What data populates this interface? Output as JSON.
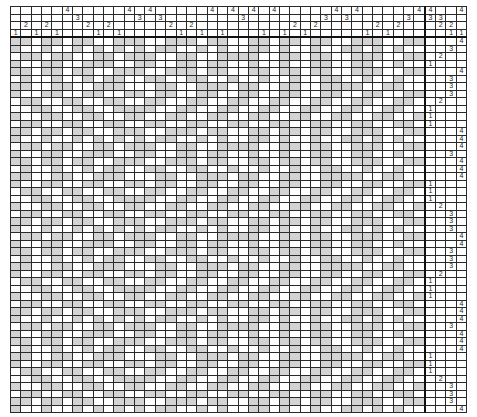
{
  "puzzle": {
    "columns": 40,
    "rows": 50,
    "shade_color": "#d3d3d3",
    "line_color": "#2a2a2a",
    "top_clues": [
      [
        "",
        "",
        "",
        "",
        "",
        "4",
        "",
        "",
        "",
        "",
        "",
        "4",
        "",
        "4",
        "",
        "",
        "",
        "",
        "",
        "4",
        "",
        "4",
        "",
        "4",
        "",
        "4",
        "",
        "",
        "",
        "",
        "",
        "4",
        "",
        "4",
        "",
        "",
        "",
        "",
        "",
        "4"
      ],
      [
        "",
        "",
        "",
        "",
        "",
        "",
        "3",
        "",
        "",
        "",
        "",
        "",
        "3",
        "",
        "3",
        "",
        "",
        "",
        "",
        "",
        "",
        "",
        "3",
        "",
        "",
        "",
        "",
        "",
        "",
        "",
        "3",
        "",
        "3",
        "",
        "",
        "",
        "",
        "",
        "3",
        ""
      ],
      [
        "",
        "2",
        "",
        "2",
        "",
        "",
        "",
        "2",
        "",
        "2",
        "",
        "",
        "",
        "",
        "",
        "2",
        "",
        "2",
        "",
        "",
        "",
        "",
        "",
        "",
        "",
        "",
        "",
        "2",
        "",
        "2",
        "",
        "",
        "",
        "",
        "",
        "2",
        "",
        "2",
        "",
        ""
      ],
      [
        "1",
        "",
        "1",
        "",
        "1",
        "",
        "",
        "",
        "1",
        "",
        "1",
        "",
        "",
        "",
        "",
        "",
        "1",
        "",
        "1",
        "",
        "1",
        "",
        "",
        "",
        "1",
        "",
        "1",
        "",
        "1",
        "",
        "",
        "",
        "",
        "",
        "1",
        "",
        "1",
        "",
        "",
        ""
      ]
    ],
    "corner_clues": [
      [
        "4",
        "",
        "",
        "4"
      ],
      [
        "3",
        "3",
        "",
        ""
      ],
      [
        "",
        "2",
        "2",
        ""
      ],
      [
        "",
        "",
        "1",
        "1"
      ]
    ],
    "right_clues": [
      [
        "",
        "",
        "",
        "4"
      ],
      [
        "",
        "",
        "3",
        ""
      ],
      [
        "",
        "2",
        "",
        ""
      ],
      [
        "1",
        "",
        "",
        ""
      ],
      [
        "",
        "",
        "",
        "4"
      ],
      [
        "",
        "",
        "3",
        ""
      ],
      [
        "",
        "",
        "3",
        ""
      ],
      [
        "",
        "",
        "3",
        ""
      ],
      [
        "",
        "2",
        "",
        ""
      ],
      [
        "1",
        "",
        "",
        ""
      ],
      [
        "1",
        "",
        "",
        ""
      ],
      [
        "1",
        "",
        "",
        ""
      ],
      [
        "",
        "",
        "",
        "4"
      ],
      [
        "",
        "",
        "",
        "4"
      ],
      [
        "",
        "",
        "",
        "4"
      ],
      [
        "",
        "",
        "3",
        ""
      ],
      [
        "",
        "",
        "",
        "4"
      ],
      [
        "",
        "",
        "",
        "4"
      ],
      [
        "",
        "",
        "",
        "4"
      ],
      [
        "1",
        "",
        "",
        ""
      ],
      [
        "1",
        "",
        "",
        ""
      ],
      [
        "1",
        "",
        "",
        ""
      ],
      [
        "",
        "2",
        "",
        ""
      ],
      [
        "",
        "",
        "3",
        ""
      ],
      [
        "",
        "",
        "3",
        ""
      ],
      [
        "",
        "",
        "3",
        ""
      ],
      [
        "",
        "",
        "",
        "4"
      ],
      [
        "",
        "",
        "",
        "4"
      ],
      [
        "",
        "",
        "3",
        ""
      ],
      [
        "",
        "",
        "3",
        ""
      ],
      [
        "",
        "",
        "3",
        ""
      ],
      [
        "",
        "2",
        "",
        ""
      ],
      [
        "1",
        "",
        "",
        ""
      ],
      [
        "1",
        "",
        "",
        ""
      ],
      [
        "1",
        "",
        "",
        ""
      ],
      [
        "",
        "",
        "",
        "4"
      ],
      [
        "",
        "",
        "",
        "4"
      ],
      [
        "",
        "",
        "",
        "4"
      ],
      [
        "",
        "",
        "3",
        ""
      ],
      [
        "",
        "",
        "",
        "4"
      ],
      [
        "",
        "",
        "",
        "4"
      ],
      [
        "",
        "",
        "",
        "4"
      ],
      [
        "1",
        "",
        "",
        ""
      ],
      [
        "1",
        "",
        "",
        ""
      ],
      [
        "1",
        "",
        "",
        ""
      ],
      [
        "",
        "2",
        "",
        ""
      ],
      [
        "",
        "",
        "3",
        ""
      ],
      [
        "",
        "",
        "3",
        ""
      ],
      [
        "",
        "",
        "3",
        ""
      ],
      [
        "",
        "",
        "",
        "4"
      ]
    ],
    "grid": [
      "##.##.##..###..###.##..##.##.##..###..##",
      "#..#..#.#.#.#.##..#.#..##.#..#..##.#.#..",
      ".##.##..##.###..##..####..##.##..###..##",
      "#..##..###..##..##.##..#..#..##..##..#..",
      "##.##.##..###..###.##..##.##.##..###..##",
      ".#..#..#.##..##..##..#..#..#..##..#..#..",
      "##..##..###...##..###.##..##..####..##..",
      "#..##..##..##.##..##..##..##..##..##..##",
      ".##..##..##..##..##..##..##..##..##..##.",
      "..##..##..####..##..##..##..##..##..##..",
      "#..##..##..##..##..##..##..##..##..##..#",
      ".##..##..##..##..##..##..##..##..##..##.",
      "##.##.##..###..###.##..##.##.##..###..##",
      "#..#..#.#.#.#.##..#.#..##.#..#..##.#.#..",
      ".##.##..##.###..##..####..##.##..###..##",
      "#..##..###..##..##.##..#..#..##..##..#..",
      "##.##.##..###..###.##..##.##.##..###..##",
      ".#..#..#.##..##..##..#..#..#..##..#..#..",
      "##..##..###...##..###.##..##..####..##..",
      "#..##..##..##.##..##..##..##..##..##..##",
      ".##..##..##..##..##..##..##..##..##..##.",
      "..##..##..####..##..##..##..##..##..##..",
      "#..##..##..##..##..##..##..##..##..##..#",
      ".##..##..##..##..##..##..##..##..##..##.",
      "##.##.##..###..###.##..##.##.##..###..##",
      "#..#..#.#.#.#.##..#.#..##.#..#..##.#.#..",
      ".##.##..##.###..##..####..##.##..###..##",
      "#..##..###..##..##.##..#..#..##..##..#..",
      "##.##.##..###..###.##..##.##.##..###..##",
      ".#..#..#.##..##..##..#..#..#..##..#..#..",
      "##..##..###...##..###.##..##..####..##..",
      "#..##..##..##.##..##..##..##..##..##..##",
      ".##..##..##..##..##..##..##..##..##..##.",
      "..##..##..####..##..##..##..##..##..##..",
      "#..##..##..##..##..##..##..##..##..##..#",
      ".##..##..##..##..##..##..##..##..##..##.",
      "##.##.##..###..###.##..##.##.##..###..##",
      "#..#..#.#.#.#.##..#.#..##.#..#..##.#.#..",
      ".##.##..##.###..##..####..##.##..###..##",
      "#..##..###..##..##.##..#..#..##..##..#..",
      "##.##.##..###..###.##..##.##.##..###..##",
      ".#..#..#.##..##..##..#..#..#..##..#..#..",
      "##..##..###...##..###.##..##..####..##..",
      "#..##..##..##.##..##..##..##..##..##..##",
      ".##..##..##..##..##..##..##..##..##..##.",
      "..##..##..####..##..##..##..##..##..##..",
      "#..##..##..##..##..##..##..##..##..##..#",
      ".##..##..##..##..##..##..##..##..##..##.",
      "##.##.##..###..###.##..##.##.##..###..##",
      "#..#..#.#.#.#.##..#.#..##.#..#..##.#.#.."
    ]
  }
}
